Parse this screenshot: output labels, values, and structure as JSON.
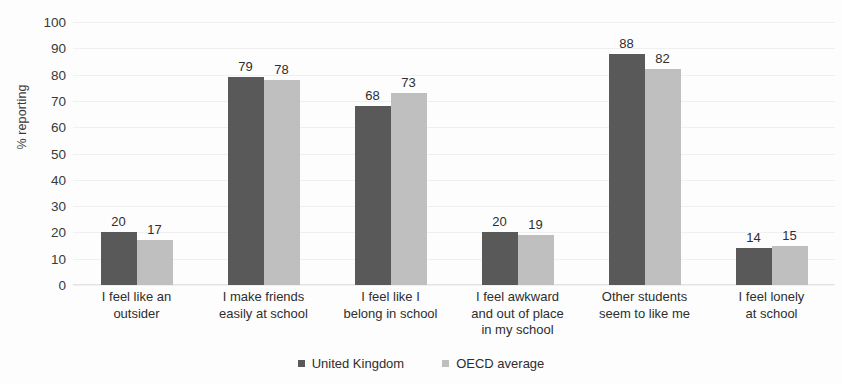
{
  "chart_data": {
    "type": "bar",
    "title": "",
    "subtitle": "",
    "xlabel": "",
    "ylabel": "% reporting",
    "ylim": [
      0,
      100
    ],
    "ytick_step": 10,
    "yticks": [
      100,
      90,
      80,
      70,
      60,
      50,
      40,
      30,
      20,
      10,
      0
    ],
    "grid": true,
    "grid_axis": "y",
    "legend_position": "bottom-center",
    "categories": [
      "I feel like an outsider",
      "I make friends easily at school",
      "I feel like I belong in school",
      "I feel awkward and out of place in my school",
      "Other students seem to like me",
      "I feel lonely at school"
    ],
    "category_lines": [
      [
        "I feel like an",
        "outsider"
      ],
      [
        "I make friends",
        "easily at school"
      ],
      [
        "I feel like I",
        "belong in school"
      ],
      [
        "I feel awkward",
        "and out of place",
        "in my school"
      ],
      [
        "Other students",
        "seem to like me"
      ],
      [
        "I feel lonely",
        "at school"
      ]
    ],
    "series": [
      {
        "name": "United Kingdom",
        "color": "#595959",
        "values": [
          20,
          79,
          68,
          20,
          88,
          14
        ]
      },
      {
        "name": "OECD average",
        "color": "#bfbfbf",
        "values": [
          17,
          78,
          73,
          19,
          82,
          15
        ]
      }
    ]
  },
  "colors": {
    "background": "#fdfdfd",
    "text": "#2e2e2e",
    "axis_text": "#3a3a3a",
    "gridline": "#f0f0f0",
    "baseline": "#e4e4e4",
    "united_kingdom": "#595959",
    "oecd_average": "#bfbfbf"
  }
}
